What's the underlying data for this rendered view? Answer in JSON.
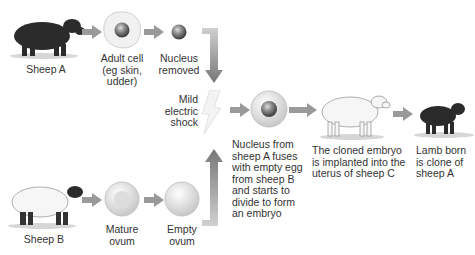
{
  "colors": {
    "arrow": "#9a9a9a",
    "arrow_dark": "#7a7a7a",
    "black_sheep": "#2b2b2b",
    "white_sheep": "#f4f4f4",
    "text": "#333333"
  },
  "top_row": {
    "sheep_a": "Sheep A",
    "adult_cell": [
      "Adult cell",
      "(eg skin,",
      "udder)"
    ],
    "nucleus_removed": [
      "Nucleus",
      "removed"
    ]
  },
  "middle": {
    "shock": [
      "Mild",
      "electric",
      "shock"
    ],
    "fusion": [
      "Nucleus from",
      "sheep A fuses",
      "with empty egg",
      "from sheep B",
      "and starts to",
      "divide to form",
      "an embryo"
    ],
    "implant": [
      "The cloned embryo",
      "is implanted into the",
      "uterus of sheep C"
    ],
    "lamb": [
      "Lamb born",
      "is clone of",
      "sheep A"
    ]
  },
  "bottom_row": {
    "sheep_b": "Sheep B",
    "mature_ovum": [
      "Mature",
      "ovum"
    ],
    "empty_ovum": [
      "Empty",
      "ovum"
    ]
  }
}
